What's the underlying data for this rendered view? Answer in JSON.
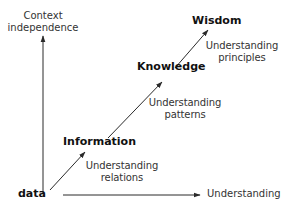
{
  "diagram": {
    "type": "DIKW hierarchy",
    "axes": {
      "y": {
        "label_line1": "Context",
        "label_line2": "independence"
      },
      "x": {
        "label": "Understanding"
      }
    },
    "stages": [
      {
        "id": "data",
        "label": "data"
      },
      {
        "id": "information",
        "label": "Information"
      },
      {
        "id": "knowledge",
        "label": "Knowledge"
      },
      {
        "id": "wisdom",
        "label": "Wisdom"
      }
    ],
    "transitions": [
      {
        "from": "data",
        "to": "information",
        "line1": "Understanding",
        "line2": "relations"
      },
      {
        "from": "information",
        "to": "knowledge",
        "line1": "Understanding",
        "line2": "patterns"
      },
      {
        "from": "knowledge",
        "to": "wisdom",
        "line1": "Understanding",
        "line2": "principles"
      }
    ],
    "colors": {
      "line": "#2a2a2a",
      "text": "#1a1a1a"
    }
  }
}
